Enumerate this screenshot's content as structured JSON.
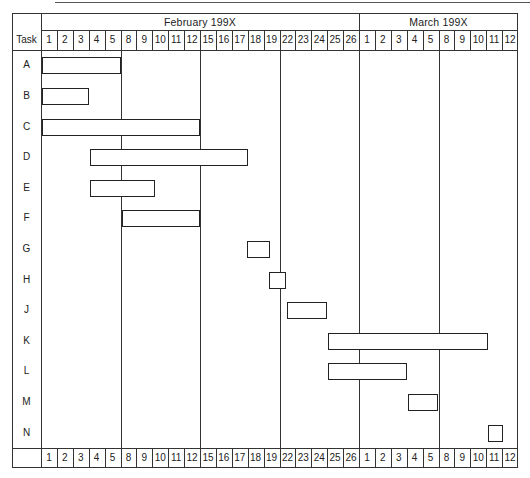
{
  "chart_data": {
    "type": "gantt",
    "title": "",
    "row_header": "Task",
    "months": [
      {
        "label": "February 199X",
        "start_col": 0,
        "span": 20
      },
      {
        "label": "March 199X",
        "start_col": 20,
        "span": 10
      }
    ],
    "days": [
      "1",
      "2",
      "3",
      "4",
      "5",
      "8",
      "9",
      "10",
      "11",
      "12",
      "15",
      "16",
      "17",
      "18",
      "19",
      "22",
      "23",
      "24",
      "25",
      "26",
      "1",
      "2",
      "3",
      "4",
      "5",
      "8",
      "9",
      "10",
      "11",
      "12"
    ],
    "week_boundaries_after_col": [
      5,
      10,
      15,
      20,
      25
    ],
    "tasks": [
      {
        "name": "A",
        "start": 0,
        "end": 5
      },
      {
        "name": "B",
        "start": 0,
        "end": 3
      },
      {
        "name": "C",
        "start": 0,
        "end": 10
      },
      {
        "name": "D",
        "start": 3,
        "end": 13
      },
      {
        "name": "E",
        "start": 3,
        "end": 7.2
      },
      {
        "name": "F",
        "start": 5,
        "end": 10
      },
      {
        "name": "G",
        "start": 12.9,
        "end": 14.4
      },
      {
        "name": "H",
        "start": 14.3,
        "end": 15.4
      },
      {
        "name": "J",
        "start": 15.4,
        "end": 18
      },
      {
        "name": "K",
        "start": 18,
        "end": 28.1
      },
      {
        "name": "L",
        "start": 18,
        "end": 23
      },
      {
        "name": "M",
        "start": 23,
        "end": 25
      },
      {
        "name": "N",
        "start": 28.05,
        "end": 29.05
      }
    ],
    "xlabel": "Working days (Feb–Mar 199X)",
    "ylabel": "Task",
    "grid": "weekly vertical lines"
  }
}
